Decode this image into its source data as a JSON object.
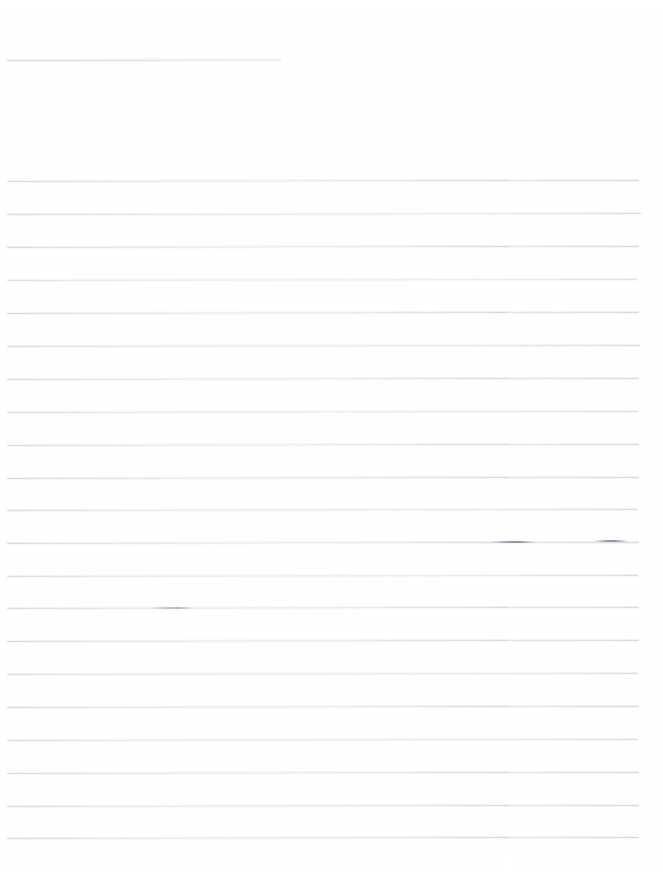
{
  "document": {
    "kind": "scanned-ruled-page",
    "page_width": 663,
    "page_height": 872,
    "background_color": "#ffffff",
    "rule_color": "#d9d9de",
    "visible_text": "",
    "text_content_note": "",
    "header_rule": {
      "name": "header-rule",
      "x": 7,
      "y": 60,
      "width": 274,
      "color": "#d5d5da",
      "slope_deg": -0.12
    },
    "ruled_block": {
      "first_line_y": 181,
      "line_spacing": 32.85,
      "line_count": 21,
      "x": 7,
      "width": 632,
      "color": "#d9d9de"
    },
    "rules": [
      {
        "label": "rule-01",
        "x": 7,
        "y": 181,
        "width": 632,
        "slope_deg": -0.1,
        "opacity": 0.95
      },
      {
        "label": "rule-02",
        "x": 7,
        "y": 214,
        "width": 634,
        "slope_deg": -0.08,
        "opacity": 0.85
      },
      {
        "label": "rule-03",
        "x": 7,
        "y": 247,
        "width": 632,
        "slope_deg": -0.1,
        "opacity": 0.95
      },
      {
        "label": "rule-04",
        "x": 7,
        "y": 280,
        "width": 630,
        "slope_deg": -0.09,
        "opacity": 0.8
      },
      {
        "label": "rule-05",
        "x": 7,
        "y": 313,
        "width": 632,
        "slope_deg": -0.1,
        "opacity": 0.95
      },
      {
        "label": "rule-06",
        "x": 7,
        "y": 346,
        "width": 633,
        "slope_deg": -0.09,
        "opacity": 0.9
      },
      {
        "label": "rule-07",
        "x": 7,
        "y": 379,
        "width": 632,
        "slope_deg": -0.1,
        "opacity": 0.95
      },
      {
        "label": "rule-08",
        "x": 7,
        "y": 412,
        "width": 631,
        "slope_deg": -0.09,
        "opacity": 0.85
      },
      {
        "label": "rule-09",
        "x": 7,
        "y": 445,
        "width": 632,
        "slope_deg": -0.1,
        "opacity": 0.9
      },
      {
        "label": "rule-10",
        "x": 7,
        "y": 478,
        "width": 632,
        "slope_deg": -0.1,
        "opacity": 0.95
      },
      {
        "label": "rule-11",
        "x": 7,
        "y": 510,
        "width": 631,
        "slope_deg": -0.09,
        "opacity": 0.88
      },
      {
        "label": "rule-12",
        "x": 7,
        "y": 543,
        "width": 632,
        "slope_deg": -0.1,
        "opacity": 0.95
      },
      {
        "label": "rule-13",
        "x": 7,
        "y": 576,
        "width": 631,
        "slope_deg": -0.09,
        "opacity": 0.88
      },
      {
        "label": "rule-14",
        "x": 7,
        "y": 608,
        "width": 632,
        "slope_deg": -0.1,
        "opacity": 0.92
      },
      {
        "label": "rule-15",
        "x": 7,
        "y": 641,
        "width": 632,
        "slope_deg": -0.1,
        "opacity": 0.95
      },
      {
        "label": "rule-16",
        "x": 7,
        "y": 674,
        "width": 631,
        "slope_deg": -0.09,
        "opacity": 0.85
      },
      {
        "label": "rule-17",
        "x": 7,
        "y": 707,
        "width": 632,
        "slope_deg": -0.1,
        "opacity": 0.95
      },
      {
        "label": "rule-18",
        "x": 7,
        "y": 740,
        "width": 631,
        "slope_deg": -0.09,
        "opacity": 0.88
      },
      {
        "label": "rule-19",
        "x": 7,
        "y": 773,
        "width": 632,
        "slope_deg": -0.1,
        "opacity": 0.95
      },
      {
        "label": "rule-20",
        "x": 7,
        "y": 806,
        "width": 632,
        "slope_deg": -0.1,
        "opacity": 0.92
      },
      {
        "label": "rule-21",
        "x": 7,
        "y": 838,
        "width": 632,
        "slope_deg": -0.1,
        "opacity": 0.95
      }
    ],
    "smudges": [
      {
        "label": "smudge-mid-left",
        "x": 150,
        "y": 607,
        "width": 44,
        "kind": "soft"
      },
      {
        "label": "smudge-mid-right",
        "x": 492,
        "y": 541,
        "width": 44,
        "kind": "hard"
      },
      {
        "label": "smudge-far-right",
        "x": 594,
        "y": 540,
        "width": 34,
        "kind": "hard"
      }
    ]
  }
}
